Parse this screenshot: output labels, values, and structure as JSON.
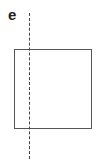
{
  "figure": {
    "panel_label": "e",
    "shapes": [
      {
        "type": "square",
        "stroke": "#555555",
        "fill": "#ffffff"
      },
      {
        "type": "dashed-vertical-line",
        "stroke": "#444444"
      }
    ]
  }
}
